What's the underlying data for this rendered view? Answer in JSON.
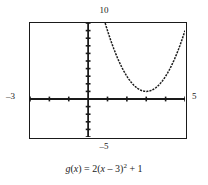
{
  "figure": {
    "caption_plain": "g(x) = 2(x - 3)^2 + 1",
    "labels": {
      "y_max": "10",
      "y_min": "–5",
      "x_min": "–3",
      "x_max": "5"
    },
    "equation_parts": {
      "fn_name": "g",
      "open_paren": "(",
      "fn_arg": "x",
      "close_paren": ")",
      "equals": " = ",
      "coefficient": "2",
      "inner_open": "(",
      "inner_var": "x",
      "inner_op": " – ",
      "inner_const": "3",
      "inner_close": ")",
      "exponent": "2",
      "tail_op": " + ",
      "tail_const": "1"
    }
  },
  "chart_data": {
    "type": "line",
    "title": "",
    "subtitle": "",
    "xlabel": "",
    "ylabel": "",
    "xlim": [
      -3,
      5
    ],
    "ylim": [
      -5,
      10
    ],
    "grid": false,
    "legend_position": "none",
    "axis_style": "graphing-calculator",
    "x_tick_step": 1,
    "y_tick_step": 1,
    "x_ticks": [
      -3,
      -2,
      -1,
      0,
      1,
      2,
      3,
      4,
      5
    ],
    "y_ticks": [
      -5,
      -4,
      -3,
      -2,
      -1,
      0,
      1,
      2,
      3,
      4,
      5,
      6,
      7,
      8,
      9,
      10
    ],
    "annotations": [
      {
        "text": "10",
        "position": "top-outside",
        "axis": "y"
      },
      {
        "text": "–5",
        "position": "bottom-outside",
        "axis": "y"
      },
      {
        "text": "–3",
        "position": "left-outside",
        "axis": "x"
      },
      {
        "text": "5",
        "position": "right-outside",
        "axis": "x"
      }
    ],
    "series": [
      {
        "name": "g(x) = 2(x – 3)² + 1",
        "equation": "y = 2*(x-3)^2 + 1",
        "vertex": [
          3,
          1
        ],
        "style": "dotted-curve",
        "color": "#1a1a1a",
        "x": [
          1.05,
          1.2,
          1.4,
          1.6,
          1.8,
          2.0,
          2.2,
          2.4,
          2.6,
          2.8,
          3.0,
          3.2,
          3.4,
          3.6,
          3.8,
          4.0,
          4.2,
          4.4,
          4.6,
          4.8,
          4.95
        ],
        "y": [
          8.6,
          6.48,
          6.12,
          4.92,
          3.88,
          3.0,
          2.28,
          1.72,
          1.32,
          1.08,
          1.0,
          1.08,
          1.32,
          1.72,
          2.28,
          3.0,
          3.88,
          4.92,
          6.12,
          7.48,
          8.6
        ]
      }
    ]
  }
}
